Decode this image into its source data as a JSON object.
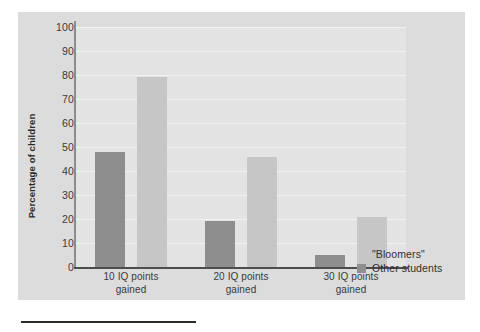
{
  "chart_data": {
    "type": "bar",
    "title": "",
    "xlabel": "",
    "ylabel": "Percentage of children",
    "categories": [
      "10 IQ points\ngained",
      "20 IQ points\ngained",
      "30 IQ points\ngained"
    ],
    "category_lines": [
      [
        "10 IQ points",
        "gained"
      ],
      [
        "20 IQ points",
        "gained"
      ],
      [
        "30 IQ points",
        "gained"
      ]
    ],
    "series": [
      {
        "name": "Other students",
        "color": "#8e8e8e",
        "values": [
          48,
          19,
          5
        ]
      },
      {
        "name": "\"Bloomers\"",
        "color": "#c6c6c6",
        "values": [
          79,
          46,
          21
        ]
      }
    ],
    "ylim": [
      0,
      100
    ],
    "ytick_values": [
      100,
      90,
      80,
      70,
      60,
      50,
      40,
      30,
      20,
      10,
      0
    ],
    "ytick_labels": [
      "100",
      "90",
      "80",
      "70",
      "60",
      "50",
      "40",
      "30",
      "20",
      "10",
      "0"
    ],
    "grid": true,
    "grid_axis": "y",
    "legend_position": "bottom-right",
    "legend_entries": [
      {
        "label": "\"Bloomers\"",
        "swatch": "light"
      },
      {
        "label": "Other students",
        "swatch": "dark"
      }
    ]
  },
  "figure": {
    "panel_color": "#dcdcdc",
    "plot_color": "#e3e3e3",
    "gridline_color": "#f2f2f2",
    "axis_color": "#4d4d4d",
    "text_color": "#3a3a3a"
  }
}
